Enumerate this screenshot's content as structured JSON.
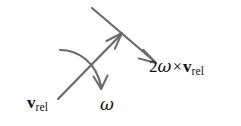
{
  "figure": {
    "kind": "vector-diagram",
    "background_color": "#ffffff",
    "stroke_color": "#6a6a6a",
    "text_color": "#111111"
  },
  "labels": {
    "relative_velocity": {
      "name": "v-rel",
      "vector_symbol": "v",
      "subscript": "rel"
    },
    "angular_velocity": {
      "name": "omega",
      "symbol": "ω"
    },
    "coriolis": {
      "name": "two-omega-cross-v-rel",
      "coefficient": "2",
      "omega_symbol": "ω",
      "cross_symbol": "×",
      "vector_symbol": "v",
      "subscript": "rel"
    }
  },
  "arrows": {
    "relative_velocity_arrow": {
      "name": "v-rel-arrow",
      "description": "straight arrow pointing up and to the right",
      "tail": [
        58,
        99
      ],
      "tip": [
        122,
        33
      ],
      "arrowhead": "open"
    },
    "coriolis_arrow": {
      "name": "coriolis-arrow",
      "description": "straight arrow pointing down and to the right, perpendicular to v_rel",
      "tail": [
        92,
        8
      ],
      "tip": [
        156,
        63
      ],
      "arrowhead": "open"
    },
    "omega_arrow": {
      "name": "omega-curved-arrow",
      "description": "curved arrow sweeping from upper-left down to lower-right indicating rotation sense",
      "start": [
        60,
        50
      ],
      "end": [
        101,
        89
      ],
      "arrowhead": "open"
    }
  }
}
